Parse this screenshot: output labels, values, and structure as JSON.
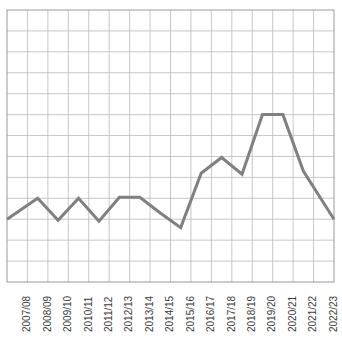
{
  "chart_data": {
    "type": "line",
    "title": "",
    "subtitle": "",
    "xlabel": "",
    "ylabel": "",
    "categories": [
      "2007/08",
      "2008/09",
      "2009/10",
      "2010/11",
      "2011/12",
      "2012/13",
      "2013/14",
      "2014/15",
      "2015/16",
      "2016/17",
      "2017/18",
      "2018/19",
      "2019/20",
      "2020/21",
      "2021/22",
      "2022/23"
    ],
    "series": [
      {
        "name": "series-1",
        "values": [
          3.0,
          4.0,
          2.95,
          4.0,
          2.9,
          4.05,
          4.05,
          3.3,
          2.6,
          5.2,
          5.95,
          5.15,
          8.0,
          8.0,
          5.3,
          3.0
        ]
      }
    ],
    "ylim": [
      0,
      13
    ],
    "xlim": [
      0,
      16
    ],
    "grid": true,
    "legend": "none",
    "legend_position": "none",
    "annotations": [],
    "tick_label_rotation": -90,
    "line_color": "#808080",
    "grid_color": "#b9b9b9",
    "axis_color": "#9a9a9a",
    "background_color": "#ffffff",
    "line_width": 3,
    "y_gridline_count": 13,
    "x_gridline_count": 16
  },
  "plot": {
    "left": 7,
    "top": 10,
    "right": 334,
    "bottom": 282
  }
}
